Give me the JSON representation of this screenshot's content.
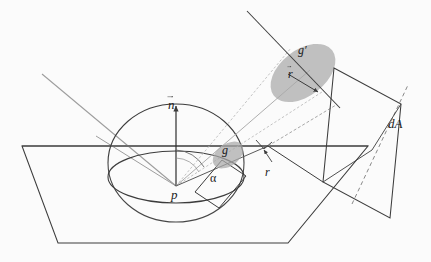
{
  "figure": {
    "background_color": "#fbfbfb",
    "line_color": "#3c3c3c",
    "light_line_color": "#9a9a9a",
    "patch_fill_color": "#a9a9a9",
    "patch_opacity": 0.72
  },
  "labels": {
    "normal_vector": "n",
    "point": "p",
    "angle": "α",
    "patch_small": "g",
    "patch_large": "g′",
    "direction_vector": "r",
    "radius": "r",
    "area_element": "dA"
  },
  "geometry": {
    "ground_plane": "22,146 196,146 368,146 288,243 58,243",
    "point_p": [
      176,
      186
    ],
    "hemisphere_radius_x": 68,
    "hemisphere_radius_y": 41,
    "normal_arrow_top": [
      176,
      104
    ],
    "da_plane_vertices": "334,68 401,104 390,218 323,182",
    "patch_small_center": [
      228,
      152
    ],
    "patch_large_center": [
      300,
      70
    ]
  }
}
